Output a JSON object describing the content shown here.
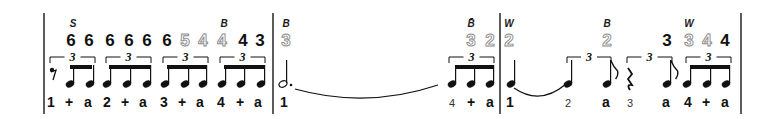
{
  "score": {
    "colors": {
      "ink": "#111111",
      "outline_number": "#8a8a8a",
      "background": "#ffffff"
    },
    "barlines_x": [
      44,
      273,
      500,
      741
    ],
    "measures": [
      {
        "index": 1,
        "labels": [
          {
            "text": "S",
            "x": 73
          },
          {
            "text": "B",
            "x": 224
          }
        ],
        "numbers": [
          {
            "text": "6",
            "x": 71,
            "style": "solid"
          },
          {
            "text": "6",
            "x": 89,
            "style": "solid"
          },
          {
            "text": "6",
            "x": 110,
            "style": "solid"
          },
          {
            "text": "6",
            "x": 129,
            "style": "solid"
          },
          {
            "text": "6",
            "x": 147,
            "style": "solid"
          },
          {
            "text": "6",
            "x": 167,
            "style": "solid"
          },
          {
            "text": "5",
            "x": 185,
            "style": "outline"
          },
          {
            "text": "4",
            "x": 203,
            "style": "outline"
          },
          {
            "text": "4",
            "x": 222,
            "style": "outline"
          },
          {
            "text": "4",
            "x": 243,
            "style": "solid"
          },
          {
            "text": "3",
            "x": 260,
            "style": "solid"
          }
        ],
        "tuplets": [
          {
            "label": "3",
            "x1": 50,
            "x2": 95
          },
          {
            "label": "3",
            "x1": 106,
            "x2": 151
          },
          {
            "label": "3",
            "x1": 163,
            "x2": 208
          },
          {
            "label": "3",
            "x1": 220,
            "x2": 265
          }
        ],
        "beams": [
          {
            "x1": 70,
            "x2": 92
          },
          {
            "x1": 109,
            "x2": 150
          },
          {
            "x1": 167,
            "x2": 206
          },
          {
            "x1": 224,
            "x2": 264
          }
        ],
        "notes": [
          {
            "type": "eighth-rest",
            "x": 53
          },
          {
            "type": "beamed",
            "x": 70
          },
          {
            "type": "beamed",
            "x": 90
          },
          {
            "type": "beamed",
            "x": 107
          },
          {
            "type": "beamed",
            "x": 127
          },
          {
            "type": "beamed",
            "x": 147
          },
          {
            "type": "beamed",
            "x": 165
          },
          {
            "type": "beamed",
            "x": 185
          },
          {
            "type": "beamed",
            "x": 203
          },
          {
            "type": "beamed",
            "x": 222
          },
          {
            "type": "beamed",
            "x": 241
          },
          {
            "type": "beamed",
            "x": 261
          }
        ],
        "counts": [
          {
            "text": "1",
            "x": 51
          },
          {
            "text": "+",
            "x": 69
          },
          {
            "text": "a",
            "x": 88
          },
          {
            "text": "2",
            "x": 107
          },
          {
            "text": "+",
            "x": 125
          },
          {
            "text": "a",
            "x": 143
          },
          {
            "text": "3",
            "x": 164
          },
          {
            "text": "+",
            "x": 182
          },
          {
            "text": "a",
            "x": 200
          },
          {
            "text": "4",
            "x": 221
          },
          {
            "text": "+",
            "x": 240
          },
          {
            "text": "a",
            "x": 258
          }
        ]
      },
      {
        "index": 2,
        "labels": [
          {
            "text": "B",
            "x": 286
          },
          {
            "text": "B̄",
            "x": 471
          }
        ],
        "numbers": [
          {
            "text": "3",
            "x": 286,
            "style": "outline"
          },
          {
            "text": "3",
            "x": 471,
            "style": "outline"
          },
          {
            "text": "2",
            "x": 490,
            "style": "outline"
          }
        ],
        "tuplets": [
          {
            "label": "3",
            "x1": 449,
            "x2": 494
          }
        ],
        "beams": [
          {
            "x1": 455,
            "x2": 493
          }
        ],
        "notes": [
          {
            "type": "dotted-half",
            "x": 283
          },
          {
            "type": "beamed",
            "x": 452
          },
          {
            "type": "beamed",
            "x": 471
          },
          {
            "type": "beamed",
            "x": 490
          }
        ],
        "ties": [
          {
            "x1": 295,
            "x2": 438,
            "y": 89,
            "depth": 10
          }
        ],
        "counts": [
          {
            "text": "1",
            "x": 284
          },
          {
            "text": "4",
            "x": 452,
            "style": "light"
          },
          {
            "text": "+",
            "x": 471
          },
          {
            "text": "a",
            "x": 490
          }
        ]
      },
      {
        "index": 3,
        "labels": [
          {
            "text": "W",
            "x": 509
          },
          {
            "text": "B",
            "x": 607
          },
          {
            "text": "W",
            "x": 689
          }
        ],
        "numbers": [
          {
            "text": "2",
            "x": 509,
            "style": "outline"
          },
          {
            "text": "2",
            "x": 607,
            "style": "outline"
          },
          {
            "text": "3",
            "x": 667,
            "style": "solid"
          },
          {
            "text": "3",
            "x": 689,
            "style": "outline"
          },
          {
            "text": "4",
            "x": 707,
            "style": "outline"
          },
          {
            "text": "4",
            "x": 725,
            "style": "solid"
          }
        ],
        "tuplets": [
          {
            "label": "3",
            "x1": 567,
            "x2": 611
          },
          {
            "label": "3",
            "x1": 627,
            "x2": 672
          },
          {
            "label": "3",
            "x1": 686,
            "x2": 731
          }
        ],
        "beams": [
          {
            "x1": 690,
            "x2": 729
          }
        ],
        "notes": [
          {
            "type": "quarter",
            "x": 511
          },
          {
            "type": "quarter",
            "x": 568
          },
          {
            "type": "eighth",
            "x": 607
          },
          {
            "type": "quarter-rest",
            "x": 630
          },
          {
            "type": "eighth",
            "x": 667
          },
          {
            "type": "beamed",
            "x": 687
          },
          {
            "type": "beamed",
            "x": 707
          },
          {
            "type": "beamed",
            "x": 726
          }
        ],
        "ties": [
          {
            "x1": 514,
            "x2": 566,
            "y": 88,
            "depth": 9
          }
        ],
        "counts": [
          {
            "text": "1",
            "x": 510
          },
          {
            "text": "2",
            "x": 568,
            "style": "light"
          },
          {
            "text": "a",
            "x": 606
          },
          {
            "text": "3",
            "x": 630,
            "style": "light"
          },
          {
            "text": "a",
            "x": 666
          },
          {
            "text": "4",
            "x": 688
          },
          {
            "text": "+",
            "x": 706
          },
          {
            "text": "a",
            "x": 725
          }
        ]
      }
    ]
  }
}
